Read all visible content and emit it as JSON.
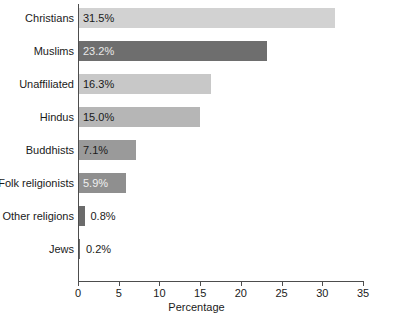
{
  "chart_data": {
    "type": "bar",
    "orientation": "horizontal",
    "title": "",
    "xlabel": "Percentage",
    "ylabel": "",
    "xlim": [
      0,
      35
    ],
    "xticks": [
      0,
      5,
      10,
      15,
      20,
      25,
      30,
      35
    ],
    "grid": false,
    "legend": false,
    "categories": [
      "Christians",
      "Muslims",
      "Unaffiliated",
      "Hindus",
      "Buddhists",
      "Folk religionists",
      "Other religions",
      "Jews"
    ],
    "values": [
      31.5,
      23.2,
      16.3,
      15.0,
      7.1,
      5.9,
      0.8,
      0.2
    ],
    "value_labels": [
      "31.5%",
      "23.2%",
      "16.3%",
      "15.0%",
      "7.1%",
      "5.9%",
      "0.8%",
      "0.2%"
    ],
    "bar_colors": [
      "#d2d2d2",
      "#6e6e6e",
      "#c8c8c8",
      "#b6b6b6",
      "#9a9a9a",
      "#8f8f8f",
      "#6b6b6b",
      "#6b6b6b"
    ],
    "label_colors": [
      "#1a1a1a",
      "#e8e8e8",
      "#1a1a1a",
      "#1a1a1a",
      "#1a1a1a",
      "#f0f0f0",
      "#1a1a1a",
      "#1a1a1a"
    ],
    "label_inside": [
      true,
      true,
      true,
      true,
      true,
      true,
      false,
      false
    ]
  },
  "axis": {
    "tick_labels": [
      "0",
      "5",
      "10",
      "15",
      "20",
      "25",
      "30",
      "35"
    ],
    "title": "Percentage"
  }
}
